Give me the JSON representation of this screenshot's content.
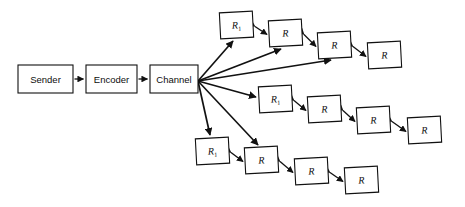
{
  "diagram": {
    "background_color": "#ffffff",
    "stroke_color": "#111111",
    "source_chain": {
      "nodes": [
        {
          "id": "sender",
          "label": "Sender",
          "x": 18,
          "y": 65,
          "w": 55,
          "h": 28
        },
        {
          "id": "encoder",
          "label": "Encoder",
          "x": 86,
          "y": 65,
          "w": 51,
          "h": 28
        },
        {
          "id": "channel",
          "label": "Channel",
          "x": 150,
          "y": 65,
          "w": 48,
          "h": 28
        }
      ],
      "connectors": [
        {
          "from": "sender",
          "to": "encoder",
          "type": "single-arrow"
        },
        {
          "from": "encoder",
          "to": "channel",
          "type": "single-arrow"
        }
      ]
    },
    "branches": [
      {
        "id": "branch-top",
        "nodes": [
          {
            "id": "t1",
            "label": "R",
            "sub": "1",
            "x": 220,
            "y": 12,
            "w": 33,
            "h": 26,
            "rot": -3
          },
          {
            "id": "t2",
            "label": "R",
            "sub": "",
            "x": 269,
            "y": 20,
            "w": 33,
            "h": 26,
            "rot": -3
          },
          {
            "id": "t3",
            "label": "R",
            "sub": "",
            "x": 318,
            "y": 32,
            "w": 33,
            "h": 26,
            "rot": -3
          },
          {
            "id": "t4",
            "label": "R",
            "sub": "",
            "x": 368,
            "y": 42,
            "w": 33,
            "h": 26,
            "rot": -3
          }
        ]
      },
      {
        "id": "branch-middle",
        "nodes": [
          {
            "id": "m1",
            "label": "R",
            "sub": "1",
            "x": 259,
            "y": 86,
            "w": 33,
            "h": 26,
            "rot": -3
          },
          {
            "id": "m2",
            "label": "R",
            "sub": "",
            "x": 308,
            "y": 96,
            "w": 33,
            "h": 26,
            "rot": -3
          },
          {
            "id": "m3",
            "label": "R",
            "sub": "",
            "x": 357,
            "y": 107,
            "w": 33,
            "h": 26,
            "rot": -3
          },
          {
            "id": "m4",
            "label": "R",
            "sub": "",
            "x": 408,
            "y": 117,
            "w": 33,
            "h": 26,
            "rot": -3
          }
        ]
      },
      {
        "id": "branch-bottom",
        "nodes": [
          {
            "id": "b1",
            "label": "R",
            "sub": "1",
            "x": 196,
            "y": 138,
            "w": 33,
            "h": 26,
            "rot": -3
          },
          {
            "id": "b2",
            "label": "R",
            "sub": "",
            "x": 245,
            "y": 147,
            "w": 33,
            "h": 26,
            "rot": -3
          },
          {
            "id": "b3",
            "label": "R",
            "sub": "",
            "x": 295,
            "y": 158,
            "w": 33,
            "h": 26,
            "rot": -3
          },
          {
            "id": "b4",
            "label": "R",
            "sub": "",
            "x": 345,
            "y": 167,
            "w": 33,
            "h": 26,
            "rot": -3
          }
        ]
      }
    ],
    "fan_origin": {
      "x": 198,
      "y": 81
    },
    "fan_rays": [
      {
        "id": "ray-1",
        "target": "t1",
        "tx": 233,
        "ty": 41
      },
      {
        "id": "ray-2",
        "target": "t2",
        "tx": 281,
        "ty": 49
      },
      {
        "id": "ray-3",
        "target": "t3",
        "tx": 331,
        "ty": 60
      },
      {
        "id": "ray-4",
        "target": "m1",
        "tx": 256,
        "ty": 97
      },
      {
        "id": "ray-5",
        "target": "b2",
        "tx": 258,
        "ty": 145
      },
      {
        "id": "ray-6",
        "target": "b1",
        "tx": 210,
        "ty": 135
      }
    ]
  }
}
